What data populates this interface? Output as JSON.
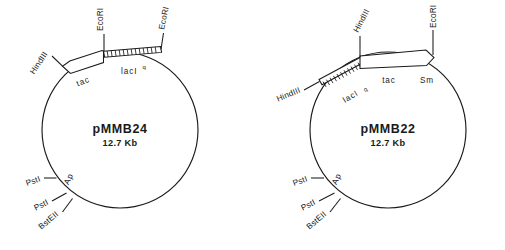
{
  "figure": {
    "background": "#ffffff",
    "stroke_color": "#1a1a1a",
    "panels": [
      {
        "id": "pMMB24",
        "name": "pMMB24",
        "size": "12.7 Kb",
        "restriction_sites": [
          {
            "label": "HindIII",
            "position": "upper-left"
          },
          {
            "label": "EcoRI",
            "position": "top-left-of-insert"
          },
          {
            "label": "EcoRI",
            "position": "top-right-of-insert"
          },
          {
            "label": "PstI",
            "position": "lower-left-upper"
          },
          {
            "label": "PstI",
            "position": "lower-left-lower"
          },
          {
            "label": "BstEII",
            "position": "bottom-left"
          }
        ],
        "gene_labels": [
          {
            "label": "tac",
            "kind": "promoter-arrow"
          },
          {
            "label": "lacI",
            "superscript": "q",
            "kind": "hatched-segment"
          },
          {
            "label": "Ap",
            "kind": "marker"
          }
        ]
      },
      {
        "id": "pMMB22",
        "name": "pMMB22",
        "size": "12.7 Kb",
        "restriction_sites": [
          {
            "label": "HindIII",
            "position": "upper-middle"
          },
          {
            "label": "HindIII",
            "position": "left"
          },
          {
            "label": "EcoRI",
            "position": "top-right"
          },
          {
            "label": "PstI",
            "position": "lower-left-upper"
          },
          {
            "label": "PstI",
            "position": "lower-left-lower"
          },
          {
            "label": "BstEII",
            "position": "bottom-left"
          }
        ],
        "gene_labels": [
          {
            "label": "lacI",
            "superscript": "q",
            "kind": "hatched-segment"
          },
          {
            "label": "tac",
            "kind": "promoter-arrow"
          },
          {
            "label": "Sm",
            "kind": "marker"
          },
          {
            "label": "Ap",
            "kind": "marker"
          }
        ]
      }
    ]
  },
  "left": {
    "name": "pMMB24",
    "size": "12.7 Kb",
    "site_hindiii": "HindIII",
    "site_ecori_1": "EcoRI",
    "site_ecori_2": "EcoRI",
    "site_psti_1": "PstI",
    "site_psti_2": "PstI",
    "site_bsteii": "BstEII",
    "gene_tac": "tac",
    "gene_laci": "lacI",
    "gene_laci_sup": "q",
    "gene_ap": "Ap"
  },
  "right": {
    "name": "pMMB22",
    "size": "12.7 Kb",
    "site_hindiii_1": "HindIII",
    "site_hindiii_2": "HindIII",
    "site_ecori": "EcoRI",
    "site_psti_1": "PstI",
    "site_psti_2": "PstI",
    "site_bsteii": "BstEII",
    "gene_laci": "lacI",
    "gene_laci_sup": "q",
    "gene_tac": "tac",
    "gene_sm": "Sm",
    "gene_ap": "Ap"
  }
}
